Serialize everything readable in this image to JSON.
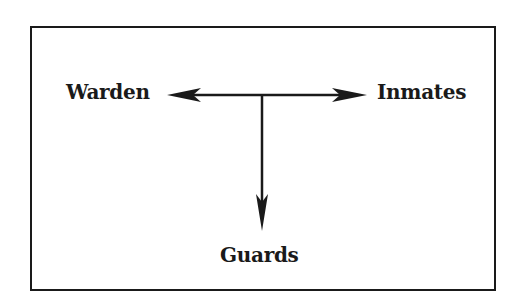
{
  "diagram": {
    "type": "hierarchy-flow",
    "nodes": {
      "warden": "Warden",
      "inmates": "Inmates",
      "guards": "Guards"
    },
    "edges": [
      {
        "from": "center",
        "to": "Warden",
        "direction": "left"
      },
      {
        "from": "center",
        "to": "Inmates",
        "direction": "right"
      },
      {
        "from": "center",
        "to": "Guards",
        "direction": "down"
      }
    ],
    "colors": {
      "line": "#1a1a1a",
      "background": "#ffffff"
    }
  }
}
